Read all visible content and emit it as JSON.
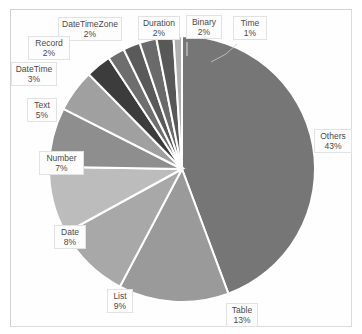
{
  "chart_data": {
    "type": "pie",
    "title": "",
    "subtitle": "",
    "xlabel": "",
    "ylabel": "",
    "legend_position": "none",
    "grid": false,
    "labels_show_percent": true,
    "total_percent": 100,
    "categories": [
      "Others",
      "Table",
      "List",
      "Date",
      "Number",
      "Text",
      "DateTime",
      "Record",
      "DateTimeZone",
      "Duration",
      "Binary",
      "Time"
    ],
    "values": [
      43,
      13,
      9,
      8,
      7,
      5,
      3,
      2,
      2,
      2,
      2,
      1
    ],
    "slices": [
      {
        "name": "Others",
        "percent": 43,
        "label": "43%",
        "color": "#767676"
      },
      {
        "name": "Table",
        "percent": 13,
        "label": "13%",
        "color": "#9a9a9a"
      },
      {
        "name": "List",
        "percent": 9,
        "label": "9%",
        "color": "#a8a8a8"
      },
      {
        "name": "Date",
        "percent": 8,
        "label": "8%",
        "color": "#bcbcbc"
      },
      {
        "name": "Number",
        "percent": 7,
        "label": "7%",
        "color": "#8e8e8e"
      },
      {
        "name": "Text",
        "percent": 5,
        "label": "5%",
        "color": "#a0a0a0"
      },
      {
        "name": "DateTime",
        "percent": 3,
        "label": "3%",
        "color": "#3c3c3c"
      },
      {
        "name": "Record",
        "percent": 2,
        "label": "2%",
        "color": "#6e6e6e"
      },
      {
        "name": "DateTimeZone",
        "percent": 2,
        "label": "2%",
        "color": "#5a5a5a"
      },
      {
        "name": "Duration",
        "percent": 2,
        "label": "2%",
        "color": "#6a6a6a"
      },
      {
        "name": "Binary",
        "percent": 2,
        "label": "2%",
        "color": "#585858"
      },
      {
        "name": "Time",
        "percent": 1,
        "label": "1%",
        "color": "#b0b0b0"
      }
    ]
  },
  "callouts": {
    "others": {
      "name": "Others",
      "percent": "43%"
    },
    "table": {
      "name": "Table",
      "percent": "13%"
    },
    "list": {
      "name": "List",
      "percent": "9%"
    },
    "date": {
      "name": "Date",
      "percent": "8%"
    },
    "number": {
      "name": "Number",
      "percent": "7%"
    },
    "text": {
      "name": "Text",
      "percent": "5%"
    },
    "datetime": {
      "name": "DateTime",
      "percent": "3%"
    },
    "record": {
      "name": "Record",
      "percent": "2%"
    },
    "datetimezone": {
      "name": "DateTimeZone",
      "percent": "2%"
    },
    "duration": {
      "name": "Duration",
      "percent": "2%"
    },
    "binary": {
      "name": "Binary",
      "percent": "2%"
    },
    "time": {
      "name": "Time",
      "percent": "1%"
    }
  }
}
